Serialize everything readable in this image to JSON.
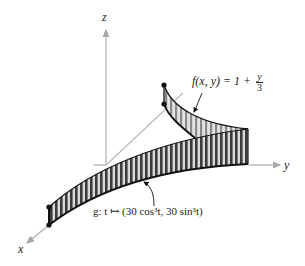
{
  "figure": {
    "type": "3d-surface-diagram",
    "axes": {
      "x_label": "x",
      "y_label": "y",
      "z_label": "z"
    },
    "function_label": {
      "lhs": "f(x, y) = 1 + ",
      "numerator": "y",
      "denominator": "3"
    },
    "curve_label": "g: t ↦ (30 cos³t, 30 sin³t)",
    "colors": {
      "axis": "#b0b0b0",
      "surface_dark": "#3a3a3a",
      "surface_light": "#d8d8d8",
      "outline": "#111111"
    }
  }
}
